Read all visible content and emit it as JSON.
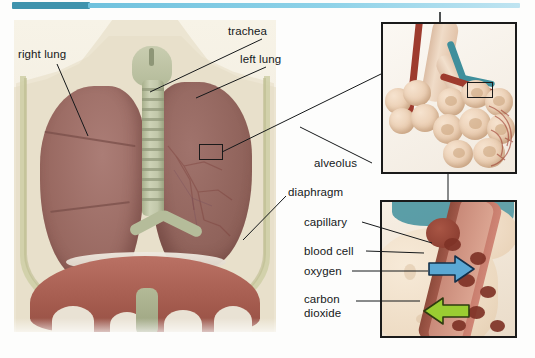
{
  "figure": {
    "header_bar": {
      "dark_color": "#3f93ad",
      "light_color": "#8ed2e8"
    }
  },
  "main_illustration": {
    "name": "thoracic-cavity-illustration",
    "labels": {
      "right_lung": "right lung",
      "trachea": "trachea",
      "left_lung": "left lung",
      "diaphragm": "diaphragm"
    }
  },
  "panel_alveolus": {
    "name": "alveolus-detail-panel",
    "labels": {
      "alveolus": "alveolus"
    }
  },
  "panel_gas_exchange": {
    "name": "gas-exchange-detail-panel",
    "labels": {
      "capillary": "capillary",
      "blood_cell": "blood cell",
      "oxygen": "oxygen",
      "carbon_dioxide_line1": "carbon",
      "carbon_dioxide_line2": "dioxide"
    },
    "arrows": [
      {
        "name": "oxygen-arrow",
        "direction": "right",
        "color": "#5ba8d4",
        "meaning": "oxygen"
      },
      {
        "name": "carbon-dioxide-arrow",
        "direction": "left",
        "color": "#9acd32",
        "meaning": "carbon dioxide"
      }
    ]
  },
  "colors": {
    "lung_tissue": "#9d6f6a",
    "diaphragm_muscle": "#a35a4d",
    "trachea_cartilage": "#c2c8aa",
    "artery_red": "#9e3b2e",
    "vein_teal": "#3f8f9c",
    "alveolus_tan": "#e8c9ac",
    "oxygen_blue": "#5ba8d4",
    "carbon_dioxide_green": "#9acd32"
  }
}
